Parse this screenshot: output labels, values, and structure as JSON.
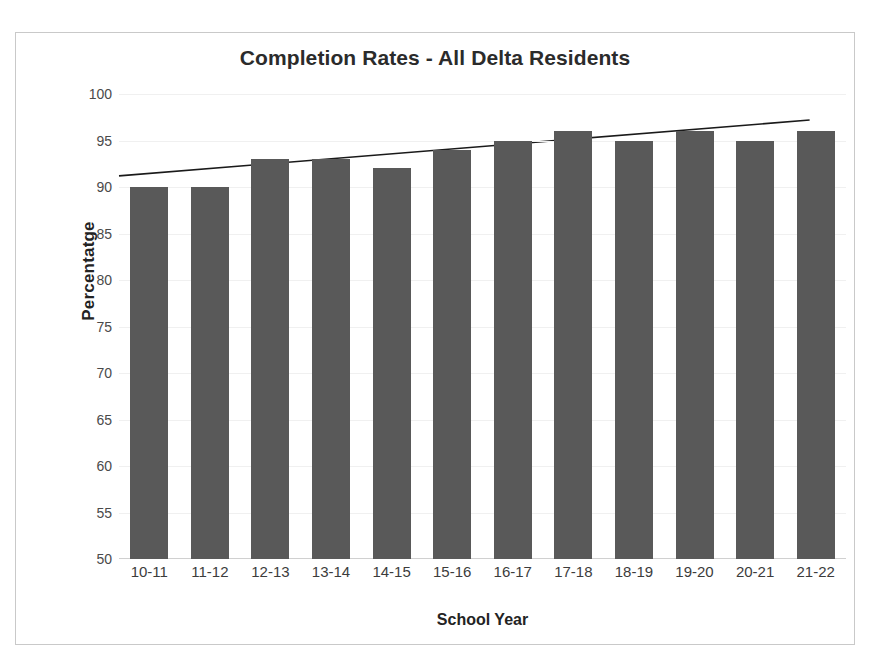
{
  "chart_data": {
    "type": "bar",
    "title": "Completion Rates - All Delta Residents",
    "xlabel": "School Year",
    "ylabel": "Percentatge",
    "categories": [
      "10-11",
      "11-12",
      "12-13",
      "13-14",
      "14-15",
      "15-16",
      "16-17",
      "17-18",
      "18-19",
      "19-20",
      "20-21",
      "21-22"
    ],
    "values": [
      90,
      90,
      93,
      93,
      92,
      94,
      95,
      96,
      95,
      96,
      95,
      96
    ],
    "series": [
      {
        "name": "Completion Rate",
        "values": [
          90,
          90,
          93,
          93,
          92,
          94,
          95,
          96,
          95,
          96,
          95,
          96
        ]
      }
    ],
    "ylim": [
      50,
      100
    ],
    "yticks": [
      100,
      95,
      90,
      85,
      80,
      75,
      70,
      65,
      60,
      55,
      50
    ],
    "ytick_labels": [
      "100",
      "95",
      "90",
      "85",
      "80",
      "75",
      "70",
      "65",
      "60",
      "55",
      "50"
    ],
    "grid": true,
    "legend": false,
    "legend_position": "none",
    "bar_color": "#595959",
    "gridline_color": "#f0f0f0",
    "axis_color": "#d0d0d0",
    "frame_color": "#c9c9c9",
    "title_color": "#2b2b2b",
    "annotations": [
      {
        "type": "trendline",
        "name": "linear-trendline",
        "color": "#1a1a1a",
        "y_start": 91.2,
        "y_end": 97.2
      }
    ]
  }
}
